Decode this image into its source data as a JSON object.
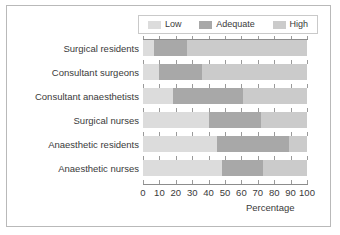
{
  "chart_data": {
    "type": "bar",
    "orientation": "horizontal",
    "stacked": true,
    "title": "",
    "xlabel": "Percentage",
    "ylabel": "",
    "xlim": [
      0,
      100
    ],
    "xticks": [
      0,
      10,
      20,
      30,
      40,
      50,
      60,
      70,
      80,
      90,
      100
    ],
    "grid": true,
    "legend_position": "top",
    "categories": [
      "Surgical residents",
      "Consultant surgeons",
      "Consultant anaesthetists",
      "Surgical nurses",
      "Anaesthetic residents",
      "Anaesthetic nurses"
    ],
    "series": [
      {
        "name": "Low",
        "color": "#dcdcdc",
        "values": [
          7,
          10,
          18,
          40,
          45,
          48
        ]
      },
      {
        "name": "Adequate",
        "color": "#a8a8a8",
        "values": [
          20,
          26,
          43,
          32,
          44,
          25
        ]
      },
      {
        "name": "High",
        "color": "#cbcbcb",
        "values": [
          73,
          64,
          39,
          28,
          11,
          27
        ]
      }
    ],
    "cumulative_boundaries": [
      {
        "category": "Surgical residents",
        "low_end": 7,
        "adequate_end": 27
      },
      {
        "category": "Consultant surgeons",
        "low_end": 10,
        "adequate_end": 36
      },
      {
        "category": "Consultant anaesthetists",
        "low_end": 18,
        "adequate_end": 61
      },
      {
        "category": "Surgical nurses",
        "low_end": 40,
        "adequate_end": 72
      },
      {
        "category": "Anaesthetic residents",
        "low_end": 45,
        "adequate_end": 89
      },
      {
        "category": "Anaesthetic nurses",
        "low_end": 48,
        "adequate_end": 73
      }
    ]
  },
  "legend": {
    "items": [
      {
        "label": "Low",
        "color": "#dcdcdc"
      },
      {
        "label": "Adequate",
        "color": "#a8a8a8"
      },
      {
        "label": "High",
        "color": "#cbcbcb"
      }
    ]
  },
  "axis": {
    "x_title": "Percentage",
    "x_tick_labels": [
      "0",
      "10",
      "20",
      "30",
      "40",
      "50",
      "60",
      "70",
      "80",
      "90",
      "100"
    ]
  },
  "colors": {
    "low": "#dcdcdc",
    "adequate": "#a8a8a8",
    "high": "#cbcbcb",
    "axis": "#8c8c8c",
    "text": "#3a3a3a",
    "frame": "#b9b9b9",
    "background": "#ffffff"
  }
}
